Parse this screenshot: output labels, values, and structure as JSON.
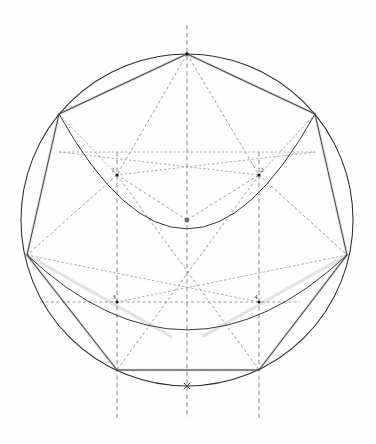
{
  "figure": {
    "background_color": "#fefefe",
    "ink_color": "#2b2b2b",
    "construction_color": "#8d8d93",
    "width": 376,
    "height": 444
  },
  "circle": {
    "label": "circumscribed-circle",
    "cx": 187,
    "cy": 220,
    "r": 166
  },
  "center": {
    "label": "center-point",
    "x": 187,
    "y": 220,
    "marker": "open-dot"
  },
  "octagon": {
    "label": "inscribed-octagon",
    "vertices": [
      {
        "name": "top",
        "x": 187,
        "y": 54
      },
      {
        "name": "upper-right",
        "x": 315,
        "y": 114
      },
      {
        "name": "right",
        "x": 347,
        "y": 255
      },
      {
        "name": "lower-right",
        "x": 259,
        "y": 370
      },
      {
        "name": "lower-left",
        "x": 117,
        "y": 370
      },
      {
        "name": "left",
        "x": 27,
        "y": 255
      },
      {
        "name": "upper-left",
        "x": 59,
        "y": 114
      }
    ]
  },
  "points": [
    {
      "id": "1",
      "label": "1",
      "x": 117,
      "y": 175,
      "label_dx": -4,
      "label_dy": -3
    },
    {
      "id": "2",
      "label": "2",
      "x": 259,
      "y": 175,
      "label_dx": 3,
      "label_dy": -3
    },
    {
      "id": "3",
      "label": "3",
      "x": 117,
      "y": 302,
      "label_dx": -3,
      "label_dy": -3
    },
    {
      "id": "4",
      "label": "4",
      "x": 259,
      "y": 302,
      "label_dx": -3,
      "label_dy": -3
    }
  ],
  "arcs": [
    {
      "name": "upper-arc-through-1-2",
      "from_x": 59,
      "from_y": 114,
      "to_x": 315,
      "to_y": 114,
      "sag_y": 229
    },
    {
      "name": "lower-arc-through-3-4",
      "from_x": 27,
      "from_y": 255,
      "to_x": 347,
      "to_y": 255,
      "sag_y": 330
    }
  ],
  "axes": [
    {
      "name": "vertical-center-axis",
      "x": 187,
      "y1": 25,
      "y2": 418
    },
    {
      "name": "vertical-axis-left",
      "x": 117,
      "y1": 152,
      "y2": 418
    },
    {
      "name": "vertical-axis-right",
      "x": 259,
      "y1": 152,
      "y2": 418
    },
    {
      "name": "horizontal-axis-through-3-4",
      "y": 302,
      "x1": 40,
      "x2": 300
    },
    {
      "name": "horizontal-chord-upper",
      "y": 152,
      "x1": 59,
      "x2": 315
    }
  ],
  "radial_lines": [
    {
      "name": "apex-to-point-1",
      "x1": 187,
      "y1": 54,
      "x2": 117,
      "y2": 175
    },
    {
      "name": "apex-to-point-2",
      "x1": 187,
      "y1": 54,
      "x2": 259,
      "y2": 175
    },
    {
      "name": "apex-to-center",
      "x1": 187,
      "y1": 54,
      "x2": 187,
      "y2": 220
    },
    {
      "name": "center-to-point-1",
      "x1": 187,
      "y1": 220,
      "x2": 117,
      "y2": 175
    },
    {
      "name": "center-to-point-2",
      "x1": 187,
      "y1": 220,
      "x2": 259,
      "y2": 175
    },
    {
      "name": "point-1-to-lower-right",
      "x1": 117,
      "y1": 175,
      "x2": 259,
      "y2": 370
    },
    {
      "name": "point-2-to-lower-left",
      "x1": 259,
      "y1": 175,
      "x2": 117,
      "y2": 370
    },
    {
      "name": "upper-left-to-point-2",
      "x1": 59,
      "y1": 114,
      "x2": 259,
      "y2": 175
    },
    {
      "name": "upper-right-to-point-1",
      "x1": 315,
      "y1": 114,
      "x2": 117,
      "y2": 175
    }
  ],
  "chords": [
    {
      "name": "chord-left-to-point-4",
      "x1": 27,
      "y1": 255,
      "x2": 259,
      "y2": 302
    },
    {
      "name": "chord-right-to-point-3",
      "x1": 347,
      "y1": 255,
      "x2": 117,
      "y2": 302
    },
    {
      "name": "chord-left-to-lower-right",
      "x1": 27,
      "y1": 255,
      "x2": 259,
      "y2": 370
    },
    {
      "name": "chord-right-to-lower-left",
      "x1": 347,
      "y1": 255,
      "x2": 117,
      "y2": 370
    }
  ],
  "bottom_marker": {
    "name": "circle-bottom-marker",
    "x": 187,
    "y": 386
  }
}
